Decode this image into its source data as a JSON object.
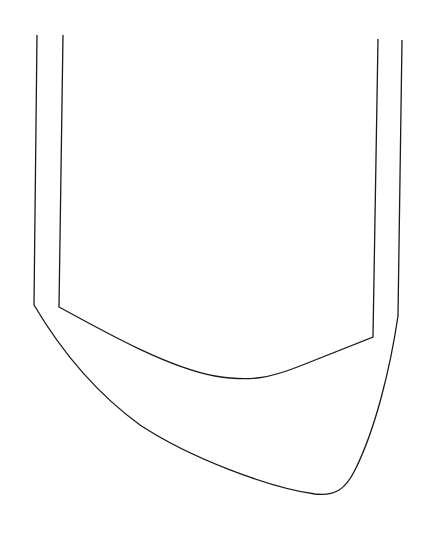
{
  "diagram": {
    "type": "line-drawing",
    "stroke_color": "#1a1a1a",
    "background": "#ffffff",
    "shapes": [
      {
        "name": "outer-outline",
        "path": "M37,35 L34,305 Q48,330 80,370 Q110,410 140,425 Q220,470 310,494 Q340,500 350,470 Q380,420 398,316 L402,40"
      },
      {
        "name": "inner-outline",
        "path": "M63,35 L59,307 Q120,340 175,365 Q230,385 275,372 L373,337 L378,39"
      }
    ]
  }
}
